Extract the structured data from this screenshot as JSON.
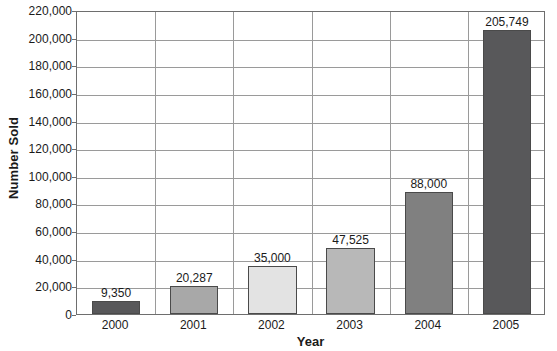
{
  "chart_data": {
    "type": "bar",
    "title": "",
    "xlabel": "Year",
    "ylabel": "Number Sold",
    "categories": [
      "2000",
      "2001",
      "2002",
      "2003",
      "2004",
      "2005"
    ],
    "values": [
      9350,
      20287,
      35000,
      47525,
      88000,
      205749
    ],
    "value_labels": [
      "9,350",
      "20,287",
      "35,000",
      "47,525",
      "88,000",
      "205,749"
    ],
    "bar_colors": [
      "#58585a",
      "#a8a8a8",
      "#e3e3e3",
      "#b8b8b8",
      "#808080",
      "#58585a"
    ],
    "bar_border_color": "#4a4a4a",
    "ylim": [
      0,
      220000
    ],
    "ytick_step": 20000,
    "ytick_labels": [
      "0",
      "20,000",
      "40,000",
      "60,000",
      "80,000",
      "100,000",
      "120,000",
      "140,000",
      "160,000",
      "180,000",
      "200,000",
      "220,000"
    ],
    "ytick_values": [
      0,
      20000,
      40000,
      60000,
      80000,
      100000,
      120000,
      140000,
      160000,
      180000,
      200000,
      220000
    ],
    "grid": {
      "horizontal": true,
      "vertical": true,
      "color": "#9a9a9a"
    },
    "axis_color": "#6e6e6e",
    "legend": null,
    "legend_position": "none",
    "background": "#ffffff"
  }
}
